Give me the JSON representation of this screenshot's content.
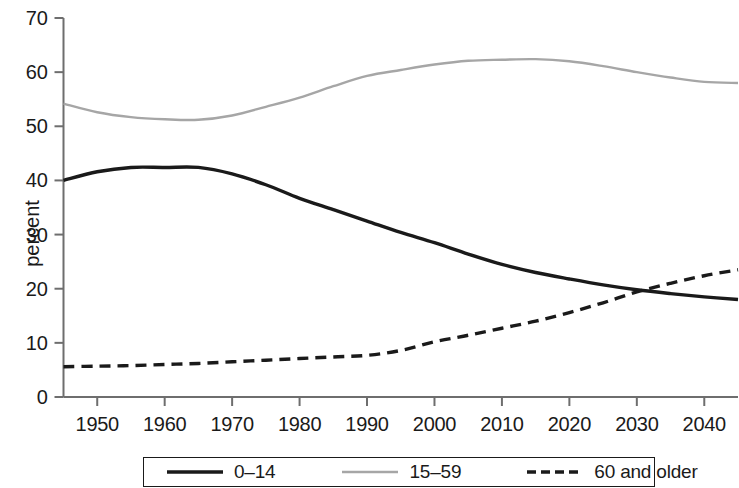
{
  "chart_data": {
    "type": "line",
    "title": "",
    "subtitle": "",
    "xlabel": "",
    "ylabel": "percent",
    "xlim": [
      1945,
      2045
    ],
    "ylim": [
      0,
      70
    ],
    "xticks": [
      1950,
      1960,
      1970,
      1980,
      1990,
      2000,
      2010,
      2020,
      2030,
      2040
    ],
    "xtick_labels": [
      "1950",
      "1960",
      "1970",
      "1980",
      "1990",
      "2000",
      "2010",
      "2020",
      "2030",
      "2040"
    ],
    "yticks": [
      0,
      10,
      20,
      30,
      40,
      50,
      60,
      70
    ],
    "ytick_labels": [
      "0",
      "10",
      "20",
      "30",
      "40",
      "50",
      "60",
      "70"
    ],
    "grid": false,
    "legend_position": "bottom",
    "x": [
      1945,
      1950,
      1955,
      1960,
      1965,
      1970,
      1975,
      1980,
      1985,
      1990,
      1995,
      2000,
      2005,
      2010,
      2015,
      2020,
      2025,
      2030,
      2035,
      2040,
      2045
    ],
    "series": [
      {
        "name": "0–14",
        "style": "solid",
        "color": "#1a1a1a",
        "width": 3.4,
        "values": [
          40.0,
          41.6,
          42.4,
          42.4,
          42.4,
          41.2,
          39.2,
          36.7,
          34.6,
          32.5,
          30.4,
          28.5,
          26.4,
          24.5,
          23.0,
          21.8,
          20.7,
          19.8,
          19.1,
          18.5,
          18.0
        ]
      },
      {
        "name": "15–59",
        "style": "solid",
        "color": "#a6a6a6",
        "width": 2.4,
        "values": [
          54.2,
          52.6,
          51.7,
          51.3,
          51.2,
          52.0,
          53.6,
          55.3,
          57.4,
          59.3,
          60.4,
          61.4,
          62.1,
          62.3,
          62.4,
          62.0,
          61.1,
          60.0,
          59.0,
          58.2,
          58.0
        ]
      },
      {
        "name": "60 and older",
        "style": "dashed",
        "color": "#1a1a1a",
        "width": 3.4,
        "values": [
          5.6,
          5.7,
          5.8,
          6.0,
          6.2,
          6.5,
          6.8,
          7.1,
          7.4,
          7.7,
          8.6,
          10.2,
          11.4,
          12.7,
          14.0,
          15.6,
          17.4,
          19.4,
          21.0,
          22.4,
          23.5
        ]
      }
    ],
    "legend": [
      {
        "label": "0–14",
        "style": "solid",
        "color": "#1a1a1a"
      },
      {
        "label": "15–59",
        "style": "solid",
        "color": "#a6a6a6"
      },
      {
        "label": "60 and older",
        "style": "dashed",
        "color": "#1a1a1a"
      }
    ],
    "axis_color": "#6e6e6e"
  }
}
